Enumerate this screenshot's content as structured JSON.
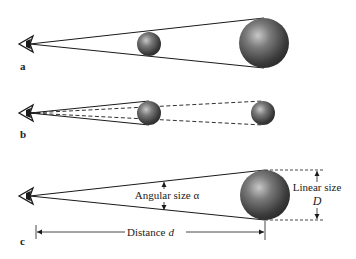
{
  "figure": {
    "panels": [
      {
        "label": "a",
        "description": "Eye viewing a near small sphere and a far large sphere subtending the same angle"
      },
      {
        "label": "b",
        "description": "Eye viewing two same-size spheres at different distances; dashed lines show the angle of the farther sphere"
      },
      {
        "label": "c",
        "description": "Relationship between angular size, linear size and distance"
      }
    ],
    "annotations": {
      "angular_size": "Angular size α",
      "linear_size": "Linear size",
      "linear_symbol": "D",
      "distance": "Distance",
      "distance_symbol": "d"
    },
    "colors": {
      "line": "#1a1a1a",
      "sphere_dark": "#2a2a2a",
      "sphere_light": "#bdbdbd",
      "text": "#222222"
    }
  }
}
